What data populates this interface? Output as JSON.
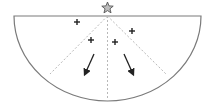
{
  "diagram": {
    "title": "",
    "colors": {
      "outline": "#7a7a7a",
      "dashed": "#b8b8b8",
      "marker": "#222222",
      "star_fill": "#bdbdbd",
      "star_stroke": "#555555"
    },
    "shapes": {
      "half_disk": {
        "cx": 107.5,
        "cy": 16,
        "rx": 93.5,
        "ry": 85
      },
      "source_star": {
        "x": 107.5,
        "y": 8,
        "label": "star-icon"
      },
      "dashed_rays": [
        {
          "x1": 107.5,
          "y1": 16,
          "x2": 50,
          "y2": 74
        },
        {
          "x1": 107.5,
          "y1": 16,
          "x2": 107.5,
          "y2": 101
        },
        {
          "x1": 107.5,
          "y1": 16,
          "x2": 166,
          "y2": 74
        }
      ],
      "crosses": [
        {
          "x": 77,
          "y": 22
        },
        {
          "x": 91,
          "y": 40
        },
        {
          "x": 115,
          "y": 42
        },
        {
          "x": 132,
          "y": 31
        }
      ],
      "arrows": [
        {
          "x1": 94,
          "y1": 54,
          "x2": 85,
          "y2": 74
        },
        {
          "x1": 124,
          "y1": 54,
          "x2": 133,
          "y2": 74
        }
      ]
    }
  }
}
